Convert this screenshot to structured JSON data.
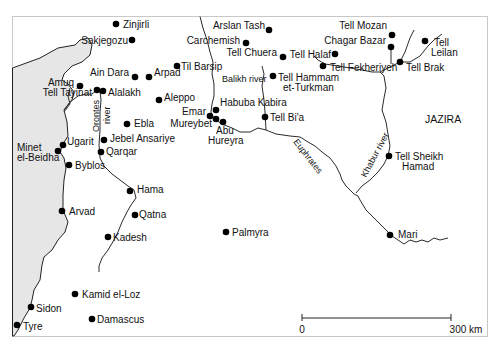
{
  "map": {
    "region_label": "JAZIRA",
    "scale": {
      "start_label": "0",
      "end_label": "300 km"
    },
    "rivers": {
      "orontes_1": "Orontes",
      "orontes_2": "river",
      "balikh": "Balikh river",
      "euphrates": "Euphrates",
      "khabur": "Khabur river"
    },
    "sites": [
      {
        "id": "zinjirli",
        "label": "Zinjirli",
        "x": 116,
        "y": 24
      },
      {
        "id": "sakjegozu",
        "label": "Sakjegozu",
        "x": 132,
        "y": 40
      },
      {
        "id": "til-barsip",
        "label": "Til Barsip",
        "x": 177,
        "y": 66
      },
      {
        "id": "ain-dara",
        "label": "Ain Dara",
        "x": 135,
        "y": 77
      },
      {
        "id": "arpad",
        "label": "Arpad",
        "x": 149,
        "y": 77
      },
      {
        "id": "amuq",
        "label": "Amuq",
        "x": 80,
        "y": 86
      },
      {
        "id": "tell-tayinat",
        "label": "Tell Tayinat",
        "x": 97,
        "y": 90
      },
      {
        "id": "alalakh",
        "label": "Alalakh",
        "x": 103,
        "y": 91
      },
      {
        "id": "aleppo",
        "label": "Aleppo",
        "x": 159,
        "y": 100
      },
      {
        "id": "ebla",
        "label": "Ebla",
        "x": 127,
        "y": 124
      },
      {
        "id": "jebel-ansariye",
        "label": "Jebel Ansariye",
        "x": 104,
        "y": 140
      },
      {
        "id": "qarqar",
        "label": "Qarqar",
        "x": 101,
        "y": 152
      },
      {
        "id": "ugarit",
        "label": "Ugarit",
        "x": 63,
        "y": 145
      },
      {
        "id": "minet-el-beidha",
        "label": "Minet el-Beidha",
        "x": 58,
        "y": 151
      },
      {
        "id": "byblos",
        "label": "Byblos",
        "x": 69,
        "y": 165
      },
      {
        "id": "hama",
        "label": "Hama",
        "x": 130,
        "y": 191
      },
      {
        "id": "arvad",
        "label": "Arvad",
        "x": 62,
        "y": 211
      },
      {
        "id": "qatna",
        "label": "Qatna",
        "x": 135,
        "y": 215
      },
      {
        "id": "kadesh",
        "label": "Kadesh",
        "x": 108,
        "y": 237
      },
      {
        "id": "palmyra",
        "label": "Palmyra",
        "x": 226,
        "y": 232
      },
      {
        "id": "kamid-el-loz",
        "label": "Kamid el-Loz",
        "x": 75,
        "y": 294
      },
      {
        "id": "sidon",
        "label": "Sidon",
        "x": 31,
        "y": 307
      },
      {
        "id": "damascus",
        "label": "Damascus",
        "x": 92,
        "y": 319
      },
      {
        "id": "tyre",
        "label": "Tyre",
        "x": 17,
        "y": 325
      },
      {
        "id": "arslan-tash",
        "label": "Arslan Tash",
        "x": 269,
        "y": 30
      },
      {
        "id": "carchemish",
        "label": "Carchemish",
        "x": 246,
        "y": 43
      },
      {
        "id": "tell-chuera",
        "label": "Tell Chuera",
        "x": 283,
        "y": 57
      },
      {
        "id": "tell-halaf",
        "label": "Tell Halaf",
        "x": 335,
        "y": 54
      },
      {
        "id": "tell-hammam-et-turkman",
        "label": "Tell Hammam et-Turkman",
        "x": 273,
        "y": 76
      },
      {
        "id": "habuba-kabira",
        "label": "Habuba Kabira",
        "x": 216,
        "y": 110
      },
      {
        "id": "emar",
        "label": "Emar",
        "x": 210,
        "y": 116
      },
      {
        "id": "mureybet",
        "label": "Mureybet",
        "x": 216,
        "y": 119
      },
      {
        "id": "abu-hureyra",
        "label": "Abu Hureyra",
        "x": 223,
        "y": 122
      },
      {
        "id": "tell-bia",
        "label": "Tell Bi'a",
        "x": 265,
        "y": 117
      },
      {
        "id": "tell-mozan",
        "label": "Tell Mozan",
        "x": 392,
        "y": 35
      },
      {
        "id": "chagar-bazar",
        "label": "Chagar Bazar",
        "x": 390,
        "y": 47
      },
      {
        "id": "tell-fekheriyeh",
        "label": "Tell Fekheriyeh",
        "x": 323,
        "y": 66
      },
      {
        "id": "tell-brak",
        "label": "Tell Brak",
        "x": 400,
        "y": 62
      },
      {
        "id": "tell-leilan",
        "label": "Tell Leilan",
        "x": 425,
        "y": 41
      },
      {
        "id": "tell-sheikh-hamad",
        "label": "Tell Sheikh Hamad",
        "x": 389,
        "y": 156
      },
      {
        "id": "mari",
        "label": "Mari",
        "x": 390,
        "y": 235
      }
    ]
  }
}
